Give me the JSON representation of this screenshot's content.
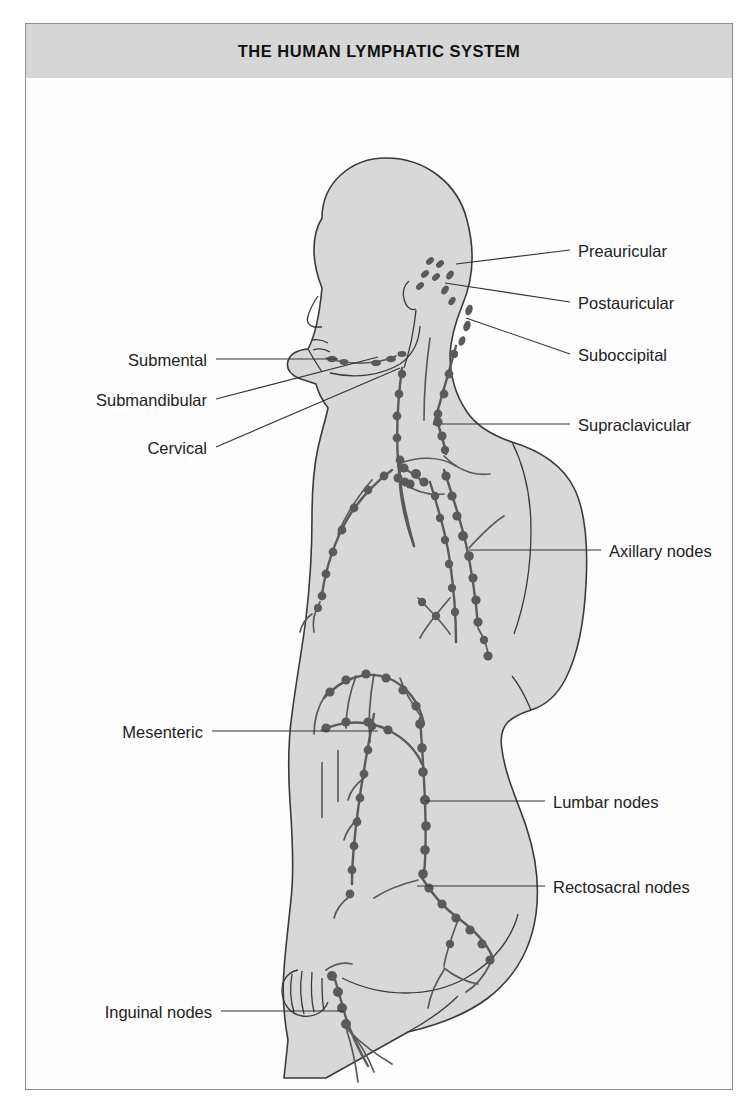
{
  "header": {
    "title": "THE HUMAN LYMPHATIC SYSTEM"
  },
  "colors": {
    "header_band": "#d6d6d6",
    "frame_border": "#8d8d8d",
    "page_background": "#ffffff",
    "figure_background": "#fdfdfd",
    "body_fill": "#d8d8d8",
    "body_outline": "#3a3a3a",
    "vessel": "#555555",
    "node": "#5a5a5a",
    "leader_line": "#333333",
    "label_text": "#222222"
  },
  "diagram": {
    "view": "right lateral / oblique posterior view of a seated human figure",
    "labels_left": [
      {
        "id": "submental",
        "text": "Submental",
        "text_right_x": 181,
        "text_y": 285,
        "leader": "M 190 281 L 312 281"
      },
      {
        "id": "submandibular",
        "text": "Submandibular",
        "text_right_x": 181,
        "text_y": 325,
        "leader": "M 190 321 L 352 279"
      },
      {
        "id": "cervical",
        "text": "Cervical",
        "text_right_x": 181,
        "text_y": 373,
        "leader": "M 190 369 L 374 290"
      },
      {
        "id": "mesenteric",
        "text": "Mesenteric",
        "text_right_x": 177,
        "text_y": 657,
        "leader": "M 186 653 L 352 653"
      },
      {
        "id": "inguinal_nodes",
        "text": "Inguinal nodes",
        "text_right_x": 186,
        "text_y": 937,
        "leader": "M 195 933 L 318 933"
      }
    ],
    "labels_right": [
      {
        "id": "preauricular",
        "text": "Preauricular",
        "text_left_x": 552,
        "text_y": 176,
        "leader": "M 544 172 L 430 186"
      },
      {
        "id": "postauricular",
        "text": "Postauricular",
        "text_left_x": 552,
        "text_y": 228,
        "leader": "M 544 224 L 419 205"
      },
      {
        "id": "suboccipital",
        "text": "Suboccipital",
        "text_left_x": 552,
        "text_y": 280,
        "leader": "M 544 276 L 440 240"
      },
      {
        "id": "supraclavicular",
        "text": "Supraclavicular",
        "text_left_x": 552,
        "text_y": 350,
        "leader": "M 544 346 L 416 346"
      },
      {
        "id": "axillary_nodes",
        "text": "Axillary nodes",
        "text_left_x": 583,
        "text_y": 476,
        "leader": "M 575 472 L 443 472"
      },
      {
        "id": "lumbar_nodes",
        "text": "Lumbar nodes",
        "text_left_x": 527,
        "text_y": 727,
        "leader": "M 519 723 L 399 723"
      },
      {
        "id": "rectosacral_nodes",
        "text": "Rectosacral nodes",
        "text_left_x": 527,
        "text_y": 812,
        "leader": "M 519 808 L 391 808"
      }
    ],
    "node_groups": [
      "preauricular",
      "postauricular",
      "suboccipital",
      "submental",
      "submandibular",
      "cervical",
      "supraclavicular",
      "axillary",
      "mesenteric",
      "lumbar",
      "rectosacral",
      "inguinal"
    ]
  }
}
